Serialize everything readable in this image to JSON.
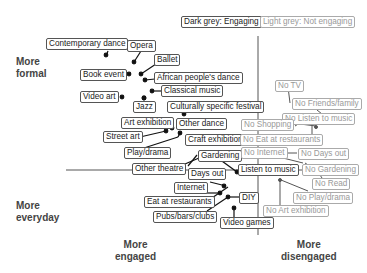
{
  "legend": {
    "engaging": "Dark grey: Engaging",
    "not_engaging": "Light grey: Not engaging"
  },
  "axes": {
    "top_left": "More formal",
    "bottom_left": "More everyday",
    "bottom_center": "More engaged",
    "bottom_right": "More disengaged",
    "top_left_lines": [
      "More",
      "formal"
    ],
    "bottom_left_lines": [
      "More",
      "everyday"
    ],
    "bottom_center_lines": [
      "More",
      "engaged"
    ],
    "bottom_right_lines": [
      "More",
      "disengaged"
    ]
  },
  "colors": {
    "engaging": "#333333",
    "not_engaging": "#999999",
    "axis": "#555555"
  },
  "engaging_items": [
    "Contemporary dance",
    "Opera",
    "Ballet",
    "Book event",
    "African people's dance",
    "Classical music",
    "Video art",
    "Jazz",
    "Culturally specific festival",
    "Art exhibition",
    "Other dance",
    "Street art",
    "Craft exhibition",
    "Play/drama",
    "Gardening",
    "Other theatre",
    "Days out",
    "Listen to music",
    "Internet",
    "DIY",
    "Eat at restaurants",
    "Pubs/bars/clubs",
    "Video games"
  ],
  "not_engaging_items": [
    "No TV",
    "No Friends/family",
    "No Listen to music",
    "No Shopping",
    "No Eat at restaurants",
    "No Internet",
    "No Days out",
    "No Gardening",
    "No Read",
    "No Play/drama",
    "No Art exhibition"
  ]
}
